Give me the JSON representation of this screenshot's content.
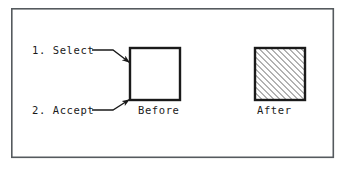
{
  "figure": {
    "background_color": "#ffffff",
    "line_color": "#1a1a1a",
    "hatch_color": "#333333",
    "frame": {
      "name": "outer-border",
      "x": 11,
      "y": 8,
      "width": 323,
      "height": 150,
      "stroke_width": 1.6
    },
    "labels": [
      {
        "id": "step-1",
        "text": "1. Select",
        "x": 32,
        "y": 54
      },
      {
        "id": "step-2",
        "text": "2. Accept",
        "x": 32,
        "y": 114
      },
      {
        "id": "before-caption",
        "text": "Before",
        "x": 138,
        "y": 114
      },
      {
        "id": "after-caption",
        "text": "After",
        "x": 257,
        "y": 114
      }
    ],
    "shapes": [
      {
        "id": "before-square",
        "name": "before-square",
        "x": 130,
        "y": 48,
        "width": 50,
        "height": 52,
        "fill": "none",
        "stroke_width": 2.2,
        "hatched": false
      },
      {
        "id": "after-square",
        "name": "after-square-hatched",
        "x": 255,
        "y": 48,
        "width": 50,
        "height": 52,
        "fill": "hatch-45",
        "stroke_width": 2.2,
        "hatched": true,
        "hatch_angle_deg": 45,
        "hatch_spacing_px": 3
      }
    ],
    "leaders": [
      {
        "id": "leader-select",
        "name": "leader-line-select",
        "points": "92,50 114,50 130,62",
        "stroke_width": 1.3,
        "arrow_at": [
          130,
          62
        ],
        "arrow_angle_deg": 37
      },
      {
        "id": "leader-accept",
        "name": "leader-line-accept",
        "points": "92,110 114,110 130,100",
        "stroke_width": 1.3,
        "arrow_at": [
          130,
          100
        ],
        "arrow_angle_deg": -32
      }
    ]
  }
}
